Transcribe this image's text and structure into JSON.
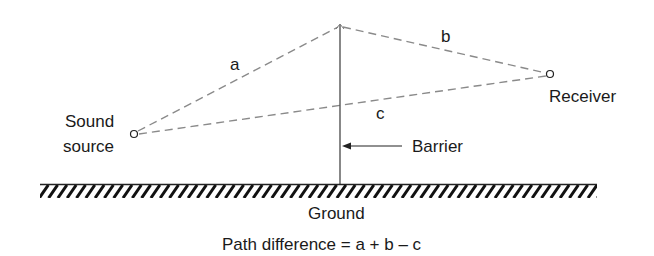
{
  "diagram": {
    "labels": {
      "path_a": "a",
      "path_b": "b",
      "path_c": "c",
      "source_line1": "Sound",
      "source_line2": "source",
      "receiver": "Receiver",
      "barrier": "Barrier",
      "ground": "Ground",
      "formula": "Path difference = a + b – c"
    },
    "points": {
      "sound_source": {
        "x": 134,
        "y": 134
      },
      "barrier_top": {
        "x": 340,
        "y": 26
      },
      "barrier_base": {
        "x": 340,
        "y": 184
      },
      "receiver": {
        "x": 550,
        "y": 74
      }
    },
    "ground": {
      "x_start": 40,
      "x_end": 597,
      "y": 184
    },
    "colors": {
      "dashed_path": "#8a8a8a",
      "ink": "#1a1a1a",
      "background": "#ffffff"
    }
  }
}
